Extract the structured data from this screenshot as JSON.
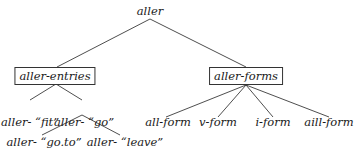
{
  "diagram": {
    "type": "tree",
    "root": {
      "label": "aller"
    },
    "nodes": [
      {
        "id": "root",
        "label": "aller",
        "x": 150,
        "y": 4,
        "boxed": false
      },
      {
        "id": "entries",
        "label": "aller-entries",
        "x": 55,
        "y": 67,
        "boxed": true
      },
      {
        "id": "forms",
        "label": "aller-forms",
        "x": 246,
        "y": 67,
        "boxed": true
      },
      {
        "id": "fit",
        "label": "aller- “fit”",
        "x": 30,
        "y": 115,
        "boxed": false
      },
      {
        "id": "go",
        "label": "aller- “go”",
        "x": 84,
        "y": 115,
        "boxed": false
      },
      {
        "id": "goto",
        "label": "aller- “go.to”",
        "x": 44,
        "y": 135,
        "boxed": false
      },
      {
        "id": "leave",
        "label": "aller- “leave”",
        "x": 125,
        "y": 135,
        "boxed": false
      },
      {
        "id": "allform",
        "label": "all-form",
        "x": 168,
        "y": 115,
        "boxed": false
      },
      {
        "id": "vform",
        "label": "v-form",
        "x": 218,
        "y": 115,
        "boxed": false
      },
      {
        "id": "iform",
        "label": "i-form",
        "x": 273,
        "y": 115,
        "boxed": false
      },
      {
        "id": "aillform",
        "label": "aill-form",
        "x": 329,
        "y": 115,
        "boxed": false
      }
    ],
    "edges": [
      {
        "from": "root",
        "to": "entries",
        "x1": 150,
        "y1": 19,
        "x2": 57,
        "y2": 67
      },
      {
        "from": "root",
        "to": "forms",
        "x1": 150,
        "y1": 19,
        "x2": 246,
        "y2": 67
      },
      {
        "from": "entries",
        "to": "fit",
        "x1": 56,
        "y1": 84,
        "x2": 30,
        "y2": 100
      },
      {
        "from": "entries",
        "to": "go",
        "x1": 56,
        "y1": 84,
        "x2": 82,
        "y2": 100
      },
      {
        "from": "go",
        "to": "goto",
        "x1": 82,
        "y1": 115,
        "x2": 42,
        "y2": 135
      },
      {
        "from": "go",
        "to": "leave",
        "x1": 82,
        "y1": 115,
        "x2": 120,
        "y2": 135
      },
      {
        "from": "forms",
        "to": "allform",
        "x1": 246,
        "y1": 85,
        "x2": 166,
        "y2": 117
      },
      {
        "from": "forms",
        "to": "vform",
        "x1": 246,
        "y1": 85,
        "x2": 218,
        "y2": 117
      },
      {
        "from": "forms",
        "to": "iform",
        "x1": 246,
        "y1": 85,
        "x2": 273,
        "y2": 117
      },
      {
        "from": "forms",
        "to": "aillform",
        "x1": 246,
        "y1": 85,
        "x2": 329,
        "y2": 117
      }
    ]
  }
}
